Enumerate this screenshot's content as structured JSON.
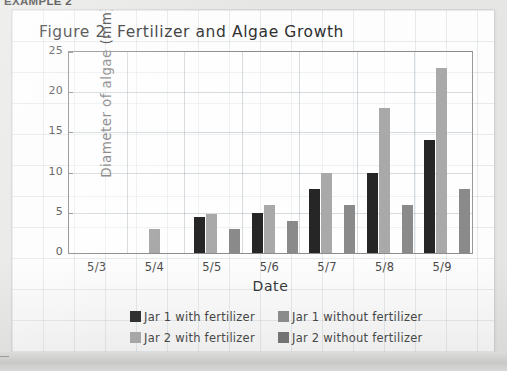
{
  "document": {
    "example_label": "EXAMPLE 2"
  },
  "chart_data": {
    "type": "bar",
    "title": "Figure 2. Fertilizer and Algae Growth",
    "xlabel": "Date",
    "ylabel": "Diameter of algae (mm)",
    "categories": [
      "5/3",
      "5/4",
      "5/5",
      "5/6",
      "5/7",
      "5/8",
      "5/9"
    ],
    "ylim": [
      0,
      25
    ],
    "yticks": [
      0,
      5,
      10,
      15,
      20,
      25
    ],
    "ytick_labels": [
      "0",
      "5",
      "10",
      "15",
      "20",
      "25"
    ],
    "grid": true,
    "legend_position": "bottom",
    "series": [
      {
        "name": "Jar 1 with fertilizer",
        "color": "#262626",
        "values": [
          0,
          0,
          4.5,
          5,
          8,
          10,
          14
        ]
      },
      {
        "name": "Jar 2 with fertilizer",
        "color": "#a9a9a9",
        "values": [
          0,
          3,
          4.8,
          6,
          10,
          18,
          23
        ]
      },
      {
        "name": "Jar 1 without fertilizer",
        "color": "#8a8a8a",
        "values": [
          0,
          0,
          3,
          4,
          6,
          6,
          8
        ]
      },
      {
        "name": "Jar 2 without fertilizer",
        "color": "#6e6e6e",
        "values": [
          0,
          0,
          0,
          0,
          0,
          0,
          0
        ]
      }
    ]
  },
  "legend": {
    "rows": [
      [
        {
          "label": "Jar 1 with fertilizer",
          "color": "#262626"
        },
        {
          "label": "Jar 1 without fertilizer",
          "color": "#8a8a8a"
        }
      ],
      [
        {
          "label": "Jar 2 with fertilizer",
          "color": "#a9a9a9"
        },
        {
          "label": "Jar 2 without fertilizer",
          "color": "#6e6e6e"
        }
      ]
    ]
  }
}
